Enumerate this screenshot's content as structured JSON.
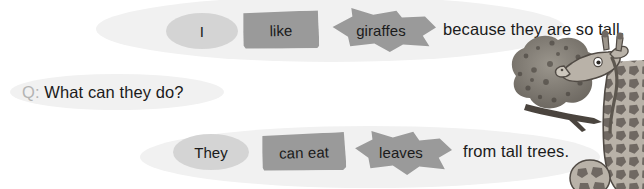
{
  "page": {
    "width": 644,
    "height": 189,
    "background": "#ffffff"
  },
  "colors": {
    "bubble_fill": "#f1f1f1",
    "oval_card_fill": "#d4d4d4",
    "solid_card_fill": "#9a9a9a",
    "text": "#1b1b1b",
    "q_marker": "#b4b4b4"
  },
  "rows": {
    "answer_1": {
      "cards": [
        {
          "id": "i",
          "shape": "oval",
          "label": "I"
        },
        {
          "id": "like",
          "shape": "rect",
          "label": "like"
        },
        {
          "id": "giraffes",
          "shape": "star",
          "label": "giraffes"
        }
      ],
      "tail_text": "because they are so tall."
    },
    "question": {
      "marker": "Q:",
      "text": "What can they do?"
    },
    "answer_2": {
      "cards": [
        {
          "id": "they",
          "shape": "oval",
          "label": "They"
        },
        {
          "id": "can-eat",
          "shape": "rect",
          "label": "can eat"
        },
        {
          "id": "leaves",
          "shape": "star",
          "label": "leaves"
        }
      ],
      "tail_text": "from tall trees."
    }
  },
  "illustration": {
    "name": "giraffes-and-tree",
    "description": "Grayscale drawing of a tall giraffe eating from a leafy tree, with a smaller giraffe head below"
  }
}
